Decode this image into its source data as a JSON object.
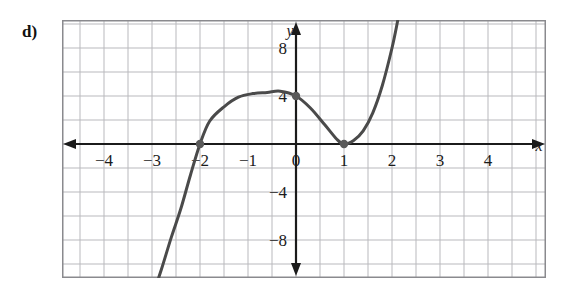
{
  "figure": {
    "part_label": "d)",
    "background_color": "#ffffff",
    "frame_color": "#8a8a8e",
    "grid_color": "#b9b9bd",
    "axis_color": "#1b1b1b",
    "curve_color": "#4a4a4a",
    "point_color": "#5a5a5a"
  },
  "chart_data": {
    "type": "line",
    "title": "",
    "xlabel": "x",
    "ylabel": "y",
    "xlim": [
      -4.85,
      5.2
    ],
    "ylim": [
      -10.3,
      10.3
    ],
    "x_ticks": [
      -4,
      -3,
      -2,
      -1,
      0,
      1,
      2,
      3,
      4
    ],
    "x_tick_labels": [
      "−4",
      "−3",
      "−2",
      "−1",
      "0",
      "1",
      "2",
      "3",
      "4"
    ],
    "y_ticks": [
      8,
      4,
      -4,
      -8
    ],
    "y_tick_labels": [
      "8",
      "4",
      "−4",
      "−8"
    ],
    "grid": true,
    "grid_step_x": 0.5,
    "grid_step_y": 2,
    "legend": "none",
    "function": "y = -2(x + 2)(x - 1)^2",
    "series": [
      {
        "name": "cubic",
        "points": [
          {
            "x": -2.95,
            "y": -12.2
          },
          {
            "x": -2.8,
            "y": -10.4
          },
          {
            "x": -2.6,
            "y": -7.8
          },
          {
            "x": -2.4,
            "y": -5.4
          },
          {
            "x": -2.2,
            "y": -2.6
          },
          {
            "x": -2.0,
            "y": 0.0
          },
          {
            "x": -1.8,
            "y": 1.9
          },
          {
            "x": -1.5,
            "y": 3.1
          },
          {
            "x": -1.2,
            "y": 3.9
          },
          {
            "x": -0.9,
            "y": 4.2
          },
          {
            "x": -0.6,
            "y": 4.3
          },
          {
            "x": -0.33,
            "y": 4.4
          },
          {
            "x": 0.0,
            "y": 4.0
          },
          {
            "x": 0.3,
            "y": 3.0
          },
          {
            "x": 0.6,
            "y": 1.6
          },
          {
            "x": 0.85,
            "y": 0.4
          },
          {
            "x": 1.0,
            "y": 0.0
          },
          {
            "x": 1.2,
            "y": 0.3
          },
          {
            "x": 1.4,
            "y": 1.1
          },
          {
            "x": 1.6,
            "y": 2.6
          },
          {
            "x": 1.8,
            "y": 4.9
          },
          {
            "x": 2.0,
            "y": 8.0
          },
          {
            "x": 2.12,
            "y": 10.3
          }
        ]
      }
    ],
    "marked_points": [
      {
        "x": -2,
        "y": 0,
        "label": "x-intercept"
      },
      {
        "x": 0,
        "y": 4,
        "label": "y-intercept"
      },
      {
        "x": 1,
        "y": 0,
        "label": "double-root"
      }
    ]
  }
}
